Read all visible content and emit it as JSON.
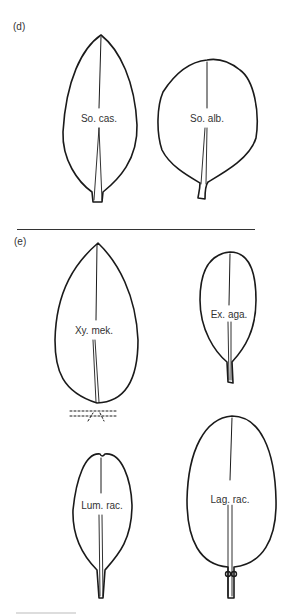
{
  "panels": [
    {
      "label": "(d)",
      "leaves": [
        {
          "name": "So. cas.",
          "shape": "lanceolate-elliptic, acute apex, short truncate petiole"
        },
        {
          "name": "So. alb.",
          "shape": "broadly ovate, short curved petiole"
        }
      ]
    },
    {
      "label": "(e)",
      "leaves": [
        {
          "name": "Xy. mek.",
          "shape": "ovate-elliptic, acute apex, dashed stem attachment"
        },
        {
          "name": "Ex. aga.",
          "shape": "obovate-elliptic, slender petiole"
        },
        {
          "name": "Lum. rac.",
          "shape": "spathulate, emarginate apex, tapering base"
        },
        {
          "name": "Lag. rac.",
          "shape": "broadly elliptic-ovate, petiole with node"
        }
      ]
    }
  ],
  "colors": {
    "line": "#1a1a1a",
    "background": "#ffffff"
  }
}
